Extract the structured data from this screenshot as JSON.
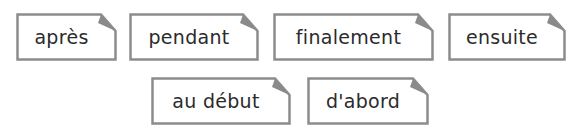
{
  "colors": {
    "border": "#8c8c8c",
    "fold": "#8a8a8a",
    "text": "#2b2b2b",
    "background": "#ffffff"
  },
  "cards": [
    {
      "label": "après",
      "x": 16,
      "y": 13,
      "w": 101
    },
    {
      "label": "pendant",
      "x": 129,
      "y": 13,
      "w": 130
    },
    {
      "label": "finalement",
      "x": 273,
      "y": 13,
      "w": 161
    },
    {
      "label": "ensuite",
      "x": 448,
      "y": 13,
      "w": 118
    },
    {
      "label": "au début",
      "x": 151,
      "y": 77,
      "w": 140
    },
    {
      "label": "d'abord",
      "x": 307,
      "y": 77,
      "w": 122
    }
  ]
}
